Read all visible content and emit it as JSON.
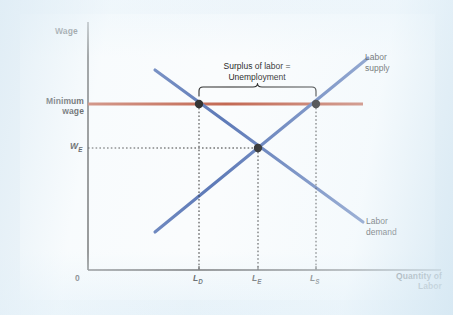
{
  "figure": {
    "type": "line-diagram",
    "axes": {
      "y_axis_label": "Wage",
      "x_axis_label": "Quantity of\nLabor",
      "origin_label": "0"
    },
    "y_ticks": [
      {
        "id": "minimum-wage",
        "label": "Minimum\nwage",
        "y_px": 104
      },
      {
        "id": "equilibrium-wage",
        "label": "W",
        "sub": "E",
        "y_px": 148
      }
    ],
    "x_ticks": [
      {
        "id": "ld",
        "label": "L",
        "sub": "D",
        "x_px": 199
      },
      {
        "id": "le",
        "label": "L",
        "sub": "E",
        "x_px": 258
      },
      {
        "id": "ls",
        "label": "L",
        "sub": "S",
        "x_px": 316
      }
    ],
    "curves": [
      {
        "id": "labor-supply",
        "label": "Labor\nsupply",
        "color": "#5573b4",
        "from": {
          "x": 155,
          "y": 232
        },
        "to": {
          "x": 368,
          "y": 58
        }
      },
      {
        "id": "labor-demand",
        "label": "Labor\ndemand",
        "color": "#5573b4",
        "from": {
          "x": 155,
          "y": 70
        },
        "to": {
          "x": 363,
          "y": 222
        }
      },
      {
        "id": "minimum-wage-line",
        "label": "Minimum wage",
        "color": "#c0614a",
        "from": {
          "x": 88,
          "y": 104
        },
        "to": {
          "x": 363,
          "y": 104
        }
      }
    ],
    "points": [
      {
        "id": "point-ld-minwage",
        "x": 199,
        "y": 104
      },
      {
        "id": "point-ls-minwage",
        "x": 316,
        "y": 104
      },
      {
        "id": "point-equilibrium",
        "x": 258,
        "y": 148
      }
    ],
    "annotation": {
      "id": "surplus-brace",
      "text": "Surplus of labor =\nUnemployment",
      "brace_left_x": 199,
      "brace_right_x": 316,
      "brace_y": 96
    }
  },
  "colors": {
    "curve_blue": "#5573b4",
    "minimum_wage_red": "#c0614a",
    "axis_black": "#4e4e4e",
    "text_black": "#141414",
    "scan_background": "#eef4f8"
  }
}
